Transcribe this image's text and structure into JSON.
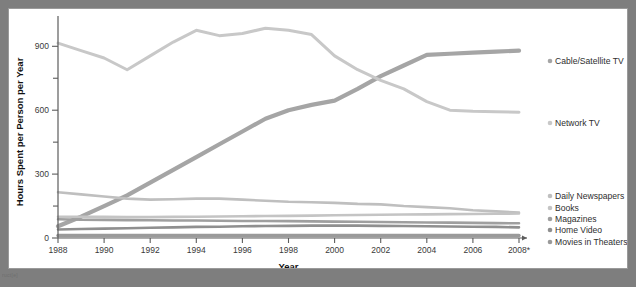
{
  "footer": {
    "mark": "ruct[e]"
  },
  "chart_data": {
    "type": "line",
    "title": "",
    "xlabel": "Year",
    "ylabel": "Hours Spent per Person per Year",
    "xlim": [
      1988,
      2008
    ],
    "ylim": [
      0,
      1000
    ],
    "yticks": [
      0,
      300,
      600,
      900
    ],
    "yticks_minor": [
      150,
      450,
      750,
      1050
    ],
    "grid": false,
    "legend_position": "right",
    "x": [
      1988,
      1989,
      1990,
      1991,
      1992,
      1993,
      1994,
      1995,
      1996,
      1997,
      1998,
      1999,
      2000,
      2001,
      2002,
      2003,
      2004,
      2005,
      2006,
      2007,
      2008
    ],
    "xtick_labels": [
      "1988",
      "1990",
      "1992",
      "1994",
      "1996",
      "1998",
      "2000",
      "2002",
      "2004",
      "2006",
      "2008*"
    ],
    "xticks": [
      1988,
      1990,
      1992,
      1994,
      1996,
      1998,
      2000,
      2002,
      2004,
      2006,
      2008
    ],
    "series": [
      {
        "name": "Cable/Satellite TV",
        "color": "#a5a5a5",
        "width": 4.2,
        "label_x": 546,
        "label_y": 55,
        "values": [
          55,
          100,
          150,
          200,
          260,
          320,
          380,
          440,
          500,
          560,
          600,
          625,
          645,
          700,
          760,
          810,
          860,
          865,
          870,
          875,
          880
        ]
      },
      {
        "name": "Network TV",
        "color": "#c8c8c8",
        "width": 3.0,
        "label_x": 546,
        "label_y": 117,
        "values": [
          915,
          880,
          845,
          790,
          855,
          920,
          975,
          950,
          960,
          985,
          975,
          955,
          855,
          790,
          740,
          700,
          640,
          600,
          595,
          593,
          590
        ]
      },
      {
        "name": "Daily Newspapers",
        "color": "#bfbfbf",
        "width": 2.6,
        "label_x": 546,
        "label_y": 190,
        "values": [
          215,
          205,
          195,
          185,
          180,
          182,
          185,
          185,
          180,
          175,
          170,
          168,
          165,
          160,
          158,
          150,
          145,
          140,
          130,
          125,
          120
        ]
      },
      {
        "name": "Books",
        "color": "#c4c4c4",
        "width": 2.6,
        "label_x": 546,
        "label_y": 202,
        "values": [
          100,
          100,
          99,
          98,
          98,
          99,
          100,
          101,
          102,
          103,
          104,
          105,
          107,
          108,
          109,
          110,
          111,
          112,
          113,
          114,
          115
        ]
      },
      {
        "name": "Magazines",
        "color": "#9f9f9f",
        "width": 2.6,
        "label_x": 546,
        "label_y": 213,
        "values": [
          88,
          86,
          85,
          84,
          83,
          82,
          82,
          81,
          80,
          80,
          79,
          78,
          77,
          76,
          75,
          74,
          73,
          72,
          71,
          70,
          69
        ]
      },
      {
        "name": "Home Video",
        "color": "#8f8f8f",
        "width": 2.6,
        "label_x": 546,
        "label_y": 224,
        "values": [
          40,
          42,
          44,
          46,
          48,
          50,
          52,
          53,
          55,
          56,
          57,
          58,
          58,
          58,
          57,
          56,
          55,
          54,
          53,
          52,
          50
        ]
      },
      {
        "name": "Movies in Theaters",
        "color": "#9a9a9a",
        "width": 3.4,
        "label_x": 546,
        "label_y": 236,
        "values": [
          12,
          12,
          12,
          12,
          12,
          12,
          12,
          12,
          12,
          12,
          12,
          12,
          12,
          12,
          12,
          12,
          12,
          12,
          12,
          12,
          12
        ]
      }
    ]
  }
}
